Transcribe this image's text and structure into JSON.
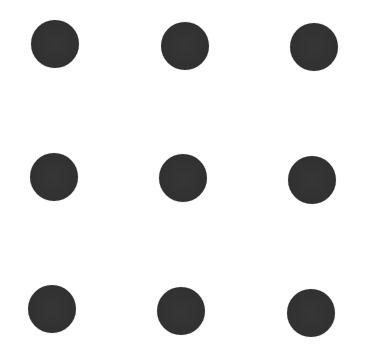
{
  "image": {
    "width": 366,
    "height": 353,
    "background": "#ffffff",
    "description": "3x3 grid of dark gray dots",
    "dot_color": "#323232",
    "dot_radius": 24
  },
  "dots": [
    {
      "row": 1,
      "col": 1,
      "cx": 55,
      "cy": 44
    },
    {
      "row": 1,
      "col": 2,
      "cx": 185,
      "cy": 46
    },
    {
      "row": 1,
      "col": 3,
      "cx": 314,
      "cy": 47
    },
    {
      "row": 2,
      "col": 1,
      "cx": 54,
      "cy": 177
    },
    {
      "row": 2,
      "col": 2,
      "cx": 183,
      "cy": 178
    },
    {
      "row": 2,
      "col": 3,
      "cx": 312,
      "cy": 180
    },
    {
      "row": 3,
      "col": 1,
      "cx": 52,
      "cy": 309
    },
    {
      "row": 3,
      "col": 2,
      "cx": 181,
      "cy": 311
    },
    {
      "row": 3,
      "col": 3,
      "cx": 311,
      "cy": 313
    }
  ]
}
